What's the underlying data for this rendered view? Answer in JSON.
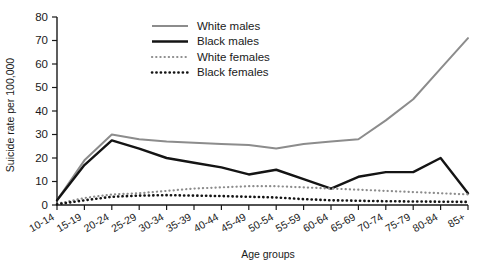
{
  "chart_data": {
    "type": "line",
    "title": "",
    "xlabel": "Age groups",
    "ylabel": "Suicide rate per 100,000",
    "ylim": [
      0,
      80
    ],
    "yticks": [
      0,
      10,
      20,
      30,
      40,
      50,
      60,
      70,
      80
    ],
    "grid": false,
    "legend_position": "top-center",
    "categories": [
      "10-14",
      "15-19",
      "20-24",
      "25-29",
      "30-34",
      "35-39",
      "40-44",
      "45-49",
      "50-54",
      "55-59",
      "60-64",
      "65-69",
      "70-74",
      "75-79",
      "80-84",
      "85+"
    ],
    "series": [
      {
        "name": "White males",
        "color": "#8c8c8c",
        "style": "solid",
        "values": [
          2,
          19,
          30,
          28,
          27,
          26.5,
          26,
          25.5,
          24,
          26,
          27,
          28,
          36,
          45,
          58,
          71
        ]
      },
      {
        "name": "Black males",
        "color": "#141414",
        "style": "solid",
        "values": [
          2,
          17,
          27.5,
          24,
          20,
          18,
          16,
          13,
          15,
          11,
          7,
          12,
          14,
          14,
          20,
          5
        ]
      },
      {
        "name": "White females",
        "color": "#8c8c8c",
        "style": "dotted",
        "values": [
          0.5,
          3,
          4.5,
          5,
          6,
          7,
          7.5,
          8,
          8,
          7.5,
          7,
          6.5,
          6,
          5.5,
          5,
          4.5
        ]
      },
      {
        "name": "Black females",
        "color": "#141414",
        "style": "dotted",
        "values": [
          0.3,
          2,
          3.5,
          4,
          4.2,
          4,
          3.8,
          3.5,
          3.2,
          2.5,
          2,
          1.8,
          1.6,
          1.5,
          1.4,
          1.3
        ]
      }
    ]
  },
  "axes": {
    "y_title": "Suicide rate per 100,000",
    "x_title": "Age groups"
  },
  "legend": {
    "items": [
      {
        "label": "White males"
      },
      {
        "label": "Black males"
      },
      {
        "label": "White females"
      },
      {
        "label": "Black females"
      }
    ]
  }
}
